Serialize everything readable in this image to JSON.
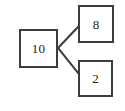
{
  "diagram": {
    "type": "number-bond",
    "background_color": "#ffffff",
    "stroke_color": "#3d3d3d",
    "text_color": "#1c1c1c",
    "nodes": [
      {
        "id": "whole",
        "role": "whole",
        "label": "10",
        "value": 10,
        "shape": "square",
        "x": 19,
        "y": 29,
        "width": 39,
        "height": 39
      },
      {
        "id": "part-1",
        "role": "part",
        "label": "8",
        "value": 8,
        "shape": "square",
        "x": 78,
        "y": 5,
        "width": 36,
        "height": 38
      },
      {
        "id": "part-2",
        "role": "part",
        "label": "2",
        "value": 2,
        "shape": "square",
        "x": 78,
        "y": 60,
        "width": 35,
        "height": 37
      }
    ],
    "edges": [
      {
        "id": "edge-whole-to-part-1",
        "from": "whole",
        "to": "part-1",
        "x1": 58,
        "y1": 48,
        "x2": 78,
        "y2": 27
      },
      {
        "id": "edge-whole-to-part-2",
        "from": "whole",
        "to": "part-2",
        "x1": 58,
        "y1": 48,
        "x2": 79,
        "y2": 74
      }
    ]
  }
}
